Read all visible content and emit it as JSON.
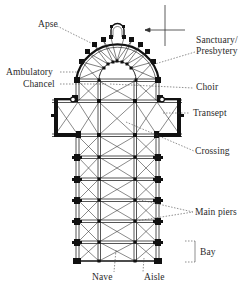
{
  "diagram": {
    "type": "cathedral-floor-plan",
    "orientation_marker": "compass-cross-with-arrow",
    "labels": {
      "apse": "Apse",
      "sanctuary": "Sanctuary/",
      "presbytery": "Presbytery",
      "ambulatory": "Ambulatory",
      "chancel": "Chancel",
      "choir": "Choir",
      "transept": "Transept",
      "crossing": "Crossing",
      "main_piers": "Main piers",
      "bay": "Bay",
      "nave": "Nave",
      "aisle": "Aisle"
    },
    "colors": {
      "line": "#2a2a2a",
      "wall": "#111111",
      "leader": "#444444",
      "background": "#ffffff"
    }
  }
}
